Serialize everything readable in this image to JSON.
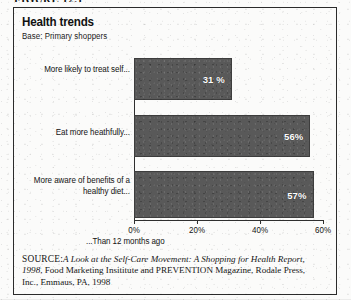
{
  "figure": {
    "caption": "FIGURE 12.1"
  },
  "panel": {
    "title": "Health trends",
    "subtitle": "Base: Primary shoppers"
  },
  "chart_data": {
    "type": "bar",
    "orientation": "horizontal",
    "title": "Health trends",
    "subtitle": "Base: Primary shoppers",
    "categories": [
      "More likely to treat self...",
      "Eat more heathfully...",
      "More aware of benefits of a healthy diet..."
    ],
    "values": [
      31,
      56,
      57
    ],
    "value_labels": [
      "31 %",
      "56%",
      "57%"
    ],
    "xlabel": "...Than 12 months ago",
    "ylabel": "",
    "xlim": [
      0,
      60
    ],
    "xticks": [
      0,
      20,
      40,
      60
    ],
    "xtick_labels": [
      "0%",
      "20%",
      "40%",
      "60%"
    ],
    "grid": false,
    "legend": false,
    "bar_color": "#595959",
    "value_label_color": "#ffffff"
  },
  "source": {
    "label": "SOURCE:",
    "italic_part": "A Look at the Self-Care Movement: A Shopping for Health Report, 1998",
    "rest": ", Food Marketing Insititute and PREVENTION Magazine, Rodale Press, Inc., Emmaus, PA, 1998"
  }
}
